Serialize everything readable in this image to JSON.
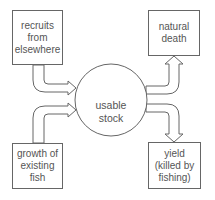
{
  "diagram": {
    "center": {
      "label": "usable\nstock"
    },
    "inputs": [
      {
        "id": "recruits",
        "label": "recruits\nfrom\nelsewhere"
      },
      {
        "id": "growth",
        "label": "growth of\nexisting\nfish"
      }
    ],
    "outputs": [
      {
        "id": "natural-death",
        "label": "natural\ndeath"
      },
      {
        "id": "yield",
        "label": "yield\n(killed by\nfishing)"
      }
    ]
  }
}
